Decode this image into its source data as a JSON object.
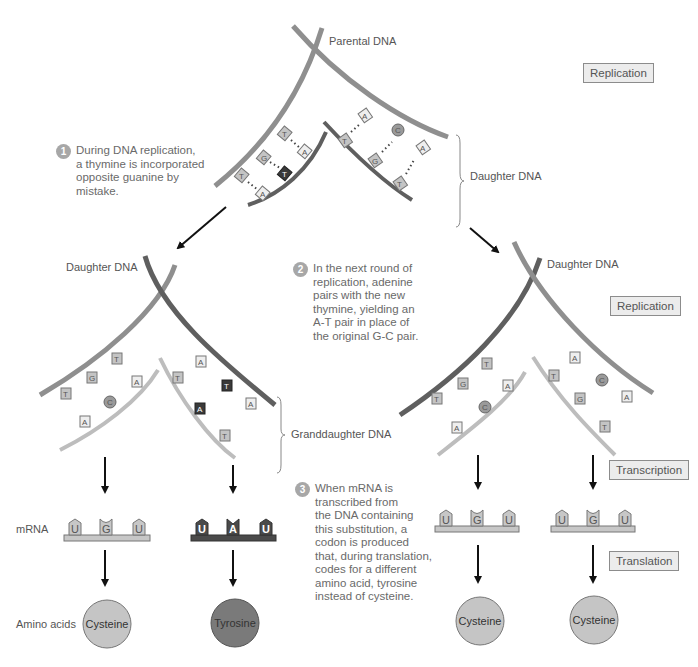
{
  "colors": {
    "strand_mid": "#8f8f8f",
    "strand_dark": "#5f5f5f",
    "strand_light": "#bdbdbd",
    "base_fill": "#c4c4c4",
    "base_dark": "#3a3a3a",
    "mrna_light": "#c7c7c7",
    "mrna_dark": "#4a4a4a",
    "cysteine": "#c5c5c5",
    "tyrosine": "#7a7a7a",
    "step_box_bg": "#ececec",
    "step_num_bg": "#a7a7a7"
  },
  "labels": {
    "parental_dna": "Parental DNA",
    "daughter_dna_top": "Daughter DNA",
    "daughter_dna_left": "Daughter DNA",
    "daughter_dna_right": "Daughter DNA",
    "granddaughter_dna": "Granddaughter DNA",
    "mrna": "mRNA",
    "amino_acids": "Amino acids"
  },
  "process_boxes": {
    "replication_top": "Replication",
    "replication_right": "Replication",
    "transcription": "Transcription",
    "translation": "Translation"
  },
  "steps": [
    {
      "number": "1",
      "lines": [
        "During DNA replication,",
        "a thymine is incorporated",
        "opposite guanine by",
        "mistake."
      ]
    },
    {
      "number": "2",
      "lines": [
        "In the next round of",
        "replication, adenine",
        "pairs with the new",
        "thymine, yielding an",
        "A-T pair in place of",
        "the original G-C pair."
      ]
    },
    {
      "number": "3",
      "lines": [
        "When mRNA is",
        "transcribed from",
        "the DNA containing",
        "this substitution, a",
        "codon is produced",
        "that, during translation,",
        "codes for a different",
        "amino acid, tyrosine",
        "instead of cysteine."
      ]
    }
  ],
  "bases": {
    "top_left_strand": [
      "T",
      "G",
      "T"
    ],
    "top_left_daughter": [
      "A",
      "T",
      "A"
    ],
    "top_right_daughter": [
      "T",
      "G",
      "T"
    ],
    "top_right_strand": [
      "A",
      "C",
      "A"
    ],
    "mid_left_outer": [
      "T",
      "G",
      "T"
    ],
    "mid_left_inner": [
      "A",
      "C",
      "A"
    ],
    "mid_left2_inner": [
      "T",
      "A",
      "T"
    ],
    "mid_left2_outer": [
      "A",
      "T",
      "A"
    ],
    "mid_right_outer": [
      "T",
      "G",
      "T"
    ],
    "mid_right_inner": [
      "A",
      "C",
      "A"
    ],
    "mid_right2_inner": [
      "T",
      "G",
      "T"
    ],
    "mid_right2_outer": [
      "A",
      "C",
      "A"
    ]
  },
  "mrna": [
    {
      "codon": [
        "U",
        "G",
        "U"
      ],
      "variant": "normal"
    },
    {
      "codon": [
        "U",
        "A",
        "U"
      ],
      "variant": "mutant"
    },
    {
      "codon": [
        "U",
        "G",
        "U"
      ],
      "variant": "normal"
    },
    {
      "codon": [
        "U",
        "G",
        "U"
      ],
      "variant": "normal"
    }
  ],
  "amino_acids": [
    {
      "name": "Cysteine",
      "variant": "normal"
    },
    {
      "name": "Tyrosine",
      "variant": "mutant"
    },
    {
      "name": "Cysteine",
      "variant": "normal"
    },
    {
      "name": "Cysteine",
      "variant": "normal"
    }
  ]
}
